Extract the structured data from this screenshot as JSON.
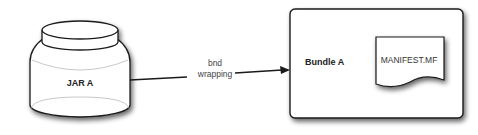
{
  "diagram": {
    "nodes": [
      {
        "id": "jar_a",
        "shape": "jar-cylinder",
        "label": "JAR A"
      },
      {
        "id": "bundle_a",
        "shape": "rounded-rectangle",
        "label": "Bundle A"
      },
      {
        "id": "manifest",
        "shape": "document",
        "label": "MANIFEST.MF",
        "parent": "bundle_a"
      }
    ],
    "edges": [
      {
        "from": "jar_a",
        "to": "bundle_a",
        "label_line1": "bnd",
        "label_line2": "wrapping",
        "arrow": "end"
      }
    ],
    "colors": {
      "stroke": "#1a1a1a",
      "fill": "#ffffff",
      "shadow": "#888888"
    }
  }
}
